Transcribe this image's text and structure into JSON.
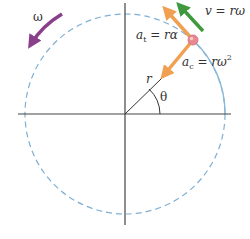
{
  "diagram": {
    "center": {
      "x": 125,
      "y": 114
    },
    "radius": 100,
    "particle": {
      "x": 193,
      "y": 40,
      "angle_deg": 47
    },
    "colors": {
      "axis": "#444444",
      "circle_dashed": "#7fb0d4",
      "circle_solid": "#8ab8d8",
      "tangential_accel": "#f0a050",
      "centripetal_accel": "#f0a050",
      "velocity": "#3f9a3f",
      "omega": "#8a3f8a",
      "particle": "#e88890"
    },
    "labels": {
      "omega": "ω",
      "velocity_lhs": "v",
      "velocity_rhs": " = rω",
      "tangential_lhs": "a",
      "tangential_sub": "t",
      "tangential_rhs": " = rα",
      "centripetal_lhs": "a",
      "centripetal_sub": "c",
      "centripetal_rhs": " = rω",
      "centripetal_sup": "2",
      "radius": "r",
      "angle": "θ"
    }
  }
}
